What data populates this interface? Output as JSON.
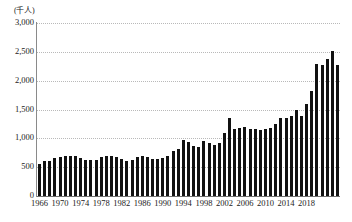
{
  "chart": {
    "unit_label": "(千人)",
    "y_axis": {
      "ticks": [
        "0",
        "500",
        "1,000",
        "1,500",
        "2,000",
        "2,500",
        "3,000"
      ],
      "min": 0,
      "max": 3000
    },
    "x_axis": {
      "tick_labels": [
        "1966",
        "1970",
        "1974",
        "1978",
        "1982",
        "1986",
        "1990",
        "1994",
        "1998",
        "2002",
        "2006",
        "2010",
        "2014",
        "2018"
      ]
    },
    "colors": {
      "bar": "#111111",
      "gridline": "#b9b9b9",
      "axis": "#6f6f6f",
      "background": "#ffffff",
      "text": "#222222"
    }
  },
  "chart_data": {
    "type": "bar",
    "title": "",
    "subtitle": "",
    "xlabel": "",
    "ylabel": "(千人)",
    "ylim": [
      0,
      3000
    ],
    "ytick_values": [
      0,
      500,
      1000,
      1500,
      2000,
      2500,
      3000
    ],
    "grid": true,
    "legend": null,
    "categories": [
      "1966",
      "1967",
      "1968",
      "1969",
      "1970",
      "1971",
      "1972",
      "1973",
      "1974",
      "1975",
      "1976",
      "1977",
      "1978",
      "1979",
      "1980",
      "1981",
      "1982",
      "1983",
      "1984",
      "1985",
      "1986",
      "1987",
      "1988",
      "1989",
      "1990",
      "1991",
      "1992",
      "1993",
      "1994",
      "1995",
      "1996",
      "1997",
      "1998",
      "1999",
      "2000",
      "2001",
      "2002",
      "2003",
      "2004",
      "2005",
      "2006",
      "2007",
      "2008",
      "2009",
      "2010",
      "2011",
      "2012",
      "2013",
      "2014",
      "2015",
      "2016",
      "2017",
      "2018"
    ],
    "values": [
      560,
      600,
      615,
      660,
      680,
      690,
      695,
      690,
      660,
      625,
      620,
      625,
      675,
      700,
      700,
      670,
      650,
      615,
      625,
      685,
      700,
      670,
      645,
      640,
      665,
      700,
      775,
      810,
      975,
      945,
      870,
      855,
      960,
      915,
      885,
      925,
      1100,
      1355,
      1155,
      1175,
      1195,
      1155,
      1165,
      1150,
      1155,
      1180,
      1245,
      1345,
      1355,
      1385,
      1490,
      1395,
      1595
    ],
    "values_tail": [
      1815,
      2290,
      2265,
      2380,
      2520,
      2275
    ]
  }
}
